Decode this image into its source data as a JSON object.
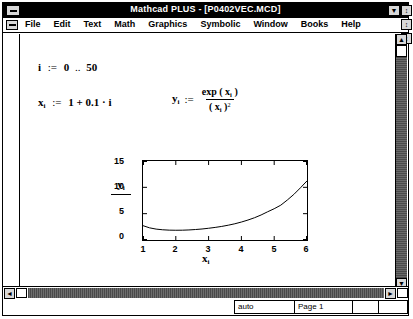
{
  "window": {
    "title": "Mathcad PLUS - [P0402VEC.MCD]",
    "sys_menu_app": "app-system-menu",
    "sys_menu_doc": "document-system-menu"
  },
  "menu": {
    "items": [
      {
        "label": "File",
        "accel": "F"
      },
      {
        "label": "Edit",
        "accel": "E"
      },
      {
        "label": "Text",
        "accel": "T"
      },
      {
        "label": "Math",
        "accel": "M"
      },
      {
        "label": "Graphics",
        "accel": "G"
      },
      {
        "label": "Symbolic",
        "accel": "S"
      },
      {
        "label": "Window",
        "accel": "W"
      },
      {
        "label": "Books",
        "accel": "B"
      },
      {
        "label": "Help",
        "accel": "H"
      }
    ]
  },
  "worksheet": {
    "range_def": {
      "var": "i",
      "assign": ":=",
      "start": "0",
      "range_op": "..",
      "end": "50",
      "text": "i := 0 .. 50"
    },
    "x_def": {
      "var": "x",
      "sub": "i",
      "assign": ":=",
      "expr": "1 + 0.1 · i",
      "text": "xᵢ := 1 + 0.1·i"
    },
    "y_def": {
      "var": "y",
      "sub": "i",
      "assign": ":=",
      "numerator": "exp ( x",
      "numerator_sub": "i",
      "numerator_close": " )",
      "denominator": "( x",
      "denominator_sub": "i",
      "denominator_close": " )",
      "denominator_pow": "2",
      "text": "yᵢ := exp(xᵢ) / (xᵢ)²"
    }
  },
  "chart_data": {
    "type": "line",
    "title": "",
    "xlabel": "x i",
    "ylabel": "y i",
    "xlim": [
      1,
      6
    ],
    "ylim": [
      0,
      15
    ],
    "xticks": [
      "1",
      "2",
      "3",
      "4",
      "5",
      "6"
    ],
    "yticks": [
      "0",
      "5",
      "10",
      "15"
    ],
    "grid": false,
    "legend": "none",
    "series": [
      {
        "name": "y_i = exp(x_i)/(x_i)^2",
        "x": [
          1.0,
          1.2,
          1.4,
          1.6,
          1.8,
          2.0,
          2.2,
          2.4,
          2.6,
          2.8,
          3.0,
          3.2,
          3.4,
          3.6,
          3.8,
          4.0,
          4.2,
          4.4,
          4.6,
          4.8,
          5.0,
          5.2,
          5.4,
          5.6,
          5.8,
          6.0
        ],
        "y": [
          2.72,
          2.31,
          2.07,
          1.94,
          1.87,
          1.85,
          1.86,
          1.91,
          1.99,
          2.09,
          2.23,
          2.39,
          2.58,
          2.81,
          3.08,
          3.41,
          3.79,
          4.23,
          4.75,
          5.36,
          5.94,
          6.61,
          7.59,
          8.66,
          9.91,
          11.22
        ]
      }
    ]
  },
  "scrollbars": {
    "v_up": "▲",
    "v_down": "▼",
    "h_left": "◄",
    "h_right": "►"
  },
  "titlebar_buttons": {
    "minimize": "▼",
    "restore": "↕"
  },
  "statusbar": {
    "auto": "auto",
    "page": "Page 1",
    "field3": "",
    "field4": ""
  }
}
